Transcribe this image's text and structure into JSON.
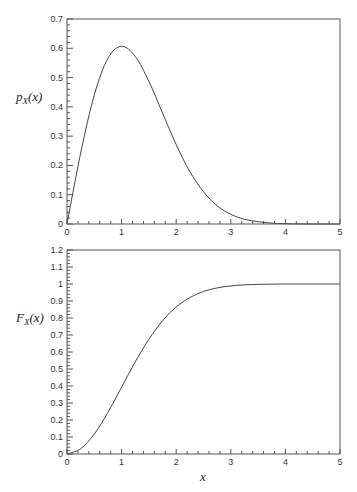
{
  "figure": {
    "width": 357,
    "height": 492,
    "line_color": "#444444",
    "frame_color": "#555555"
  },
  "chart_data": [
    {
      "type": "line",
      "id": "pdf",
      "title": "",
      "xlabel": "",
      "ylabel": "p_X(x)",
      "ylabel_main": "p",
      "ylabel_sub": "X",
      "ylabel_arg": "(x)",
      "xlim": [
        0,
        5
      ],
      "ylim": [
        0,
        0.7
      ],
      "xticks": [
        0,
        1,
        2,
        3,
        4,
        5
      ],
      "xtick_labels": [
        "0",
        "1",
        "2",
        "3",
        "4",
        "5"
      ],
      "yticks": [
        0,
        0.1,
        0.2,
        0.3,
        0.4,
        0.5,
        0.6,
        0.7
      ],
      "ytick_labels": [
        "0",
        "0.1",
        "0.2",
        "0.3",
        "0.4",
        "0.5",
        "0.6",
        "0.7"
      ],
      "minor_ticks_per_interval": 4,
      "grid": false,
      "series": [
        {
          "name": "p_X(x)",
          "x": [
            0,
            0.25,
            0.5,
            0.75,
            1,
            1.25,
            1.5,
            1.75,
            2,
            2.25,
            2.5,
            2.75,
            3,
            3.25,
            3.5,
            3.75,
            4,
            4.5,
            5
          ],
          "values": [
            0,
            0.242,
            0.441,
            0.566,
            0.607,
            0.572,
            0.487,
            0.379,
            0.271,
            0.179,
            0.11,
            0.062,
            0.033,
            0.016,
            0.008,
            0.003,
            0.001,
            0.0,
            0.0
          ]
        }
      ]
    },
    {
      "type": "line",
      "id": "cdf",
      "title": "",
      "xlabel": "x",
      "ylabel": "F_X(x)",
      "ylabel_main": "F",
      "ylabel_sub": "X",
      "ylabel_arg": "(x)",
      "xlim": [
        0,
        5
      ],
      "ylim": [
        0,
        1.2
      ],
      "xticks": [
        0,
        1,
        2,
        3,
        4,
        5
      ],
      "xtick_labels": [
        "0",
        "1",
        "2",
        "3",
        "4",
        "5"
      ],
      "yticks": [
        0,
        0.1,
        0.2,
        0.3,
        0.4,
        0.5,
        0.6,
        0.7,
        0.8,
        0.9,
        1,
        1.1,
        1.2
      ],
      "ytick_labels": [
        "0",
        "0.1",
        "0.2",
        "0.3",
        "0.4",
        "0.5",
        "0.6",
        "0.7",
        "0.8",
        "0.9",
        "1",
        "1.1",
        "1.2"
      ],
      "minor_ticks_per_interval": 4,
      "grid": false,
      "series": [
        {
          "name": "F_X(x)",
          "x": [
            0,
            0.25,
            0.5,
            0.75,
            1,
            1.25,
            1.5,
            1.75,
            2,
            2.25,
            2.5,
            2.75,
            3,
            3.25,
            3.5,
            3.75,
            4,
            4.5,
            5
          ],
          "values": [
            0,
            0.031,
            0.118,
            0.245,
            0.393,
            0.542,
            0.675,
            0.784,
            0.865,
            0.92,
            0.956,
            0.977,
            0.989,
            0.995,
            0.998,
            0.999,
            1.0,
            1.0,
            1.0
          ]
        }
      ]
    }
  ]
}
